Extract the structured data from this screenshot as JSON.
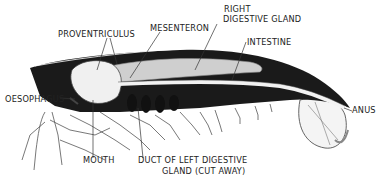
{
  "diagram": {
    "colors": {
      "ink": "#1a1a1a",
      "background": "#ffffff",
      "gland_fill": "#cfcfcf",
      "outline": "#444444"
    },
    "labels": {
      "proventriculus": "PROVENTRICULUS",
      "mesenteron": "MESENTERON",
      "right_digestive_gland_1": "RIGHT",
      "right_digestive_gland_2": "DIGESTIVE GLAND",
      "intestine": "INTESTINE",
      "oesophagus": "OESOPHAGUS",
      "anus": "ANUS",
      "mouth": "MOUTH",
      "duct_1": "DUCT OF LEFT DIGESTIVE",
      "duct_2": "GLAND (CUT AWAY)"
    }
  }
}
